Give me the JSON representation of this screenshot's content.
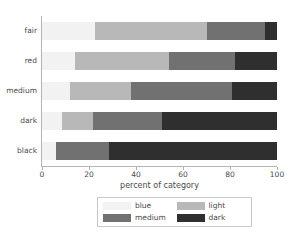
{
  "chart_data": {
    "type": "bar",
    "orientation": "horizontal",
    "stacked": true,
    "normalized": true,
    "title": "",
    "xlabel": "percent of category",
    "ylabel": "",
    "xlim": [
      0,
      100
    ],
    "xticks": [
      0,
      20,
      40,
      60,
      80,
      100
    ],
    "xticklabels": [
      "0",
      "20",
      "40",
      "60",
      "80",
      "100"
    ],
    "grid": false,
    "legend_position": "below-center",
    "categories": [
      "fair",
      "red",
      "medium",
      "dark",
      "black"
    ],
    "series": [
      {
        "name": "blue",
        "color": "#f2f2f2",
        "values": [
          22.5,
          14.0,
          12.0,
          8.5,
          6.0
        ]
      },
      {
        "name": "light",
        "color": "#b8b8b8",
        "values": [
          47.5,
          40.0,
          26.0,
          13.0,
          0.0
        ]
      },
      {
        "name": "medium",
        "color": "#717171",
        "values": [
          25.0,
          28.0,
          43.0,
          29.5,
          22.5
        ]
      },
      {
        "name": "dark",
        "color": "#2f2f2f",
        "values": [
          5.0,
          18.0,
          19.0,
          49.0,
          71.5
        ]
      }
    ],
    "legend_entries": [
      {
        "label": "blue",
        "color": "#f2f2f2"
      },
      {
        "label": "light",
        "color": "#b8b8b8"
      },
      {
        "label": "medium",
        "color": "#717171"
      },
      {
        "label": "dark",
        "color": "#2f2f2f"
      }
    ],
    "axis_color": "#b4b4b4",
    "text_color": "#4a4a4a",
    "background": "#ffffff"
  }
}
